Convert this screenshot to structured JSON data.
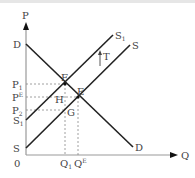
{
  "diagram": {
    "title": "",
    "axes": {
      "y_label": "P",
      "x_label": "Q",
      "origin_label": "0"
    },
    "curves": [
      {
        "name": "D",
        "label": "D",
        "end_label": "D"
      },
      {
        "name": "S",
        "label": "S",
        "end_label": "S"
      },
      {
        "name": "S1",
        "label": "S",
        "label_sub": "1",
        "end_label": "S",
        "end_label_sub": "1"
      }
    ],
    "points": {
      "F": "F",
      "E": "E",
      "H": "H",
      "G": "G"
    },
    "price_labels": {
      "P1": {
        "main": "P",
        "sub": "1"
      },
      "PE": {
        "main": "P",
        "sup": "E"
      },
      "P2": {
        "main": "P",
        "sub": "2"
      }
    },
    "quantity_labels": {
      "Q1": {
        "main": "Q",
        "sub": "1"
      },
      "QE": {
        "main": "Q",
        "sup": "E"
      }
    },
    "shift_label": "T",
    "colors": {
      "line": "#222222",
      "axis": "#999999",
      "dash": "#888888",
      "text": "#444444"
    }
  }
}
